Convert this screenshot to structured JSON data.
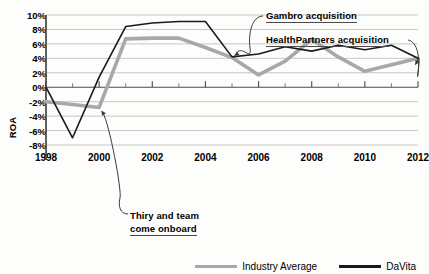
{
  "chart_data": {
    "type": "line",
    "title": "",
    "xlabel": "",
    "ylabel": "ROA",
    "xlim": [
      1998,
      2012
    ],
    "ylim": [
      -8,
      10
    ],
    "ytick_labels": [
      "10%",
      "8%",
      "6%",
      "4%",
      "2%",
      "0%",
      "-2%",
      "-4%",
      "-6%",
      "-8%"
    ],
    "ytick_values": [
      10,
      8,
      6,
      4,
      2,
      0,
      -2,
      -4,
      -6,
      -8
    ],
    "xtick_labels": [
      "1998",
      "2000",
      "2002",
      "2004",
      "2006",
      "2008",
      "2010",
      "2012"
    ],
    "xtick_values": [
      1998,
      2000,
      2002,
      2004,
      2006,
      2008,
      2010,
      2012
    ],
    "minor_xtick_values": [
      1999,
      2001,
      2003,
      2005,
      2007,
      2009,
      2011
    ],
    "grid": "horizontal",
    "legend_position": "bottom-right",
    "x": [
      1998,
      1999,
      2000,
      2001,
      2002,
      2003,
      2004,
      2005,
      2006,
      2007,
      2008,
      2009,
      2010,
      2011,
      2012
    ],
    "series": [
      {
        "name": "Industry Average",
        "color": "#a8a8a8",
        "width": 3.6,
        "values": [
          -2.0,
          -2.4,
          -2.8,
          6.7,
          6.8,
          6.8,
          5.5,
          4.1,
          1.7,
          3.6,
          6.6,
          4.2,
          2.2,
          3.1,
          4.0
        ]
      },
      {
        "name": "DaVita",
        "color": "#1a1a1a",
        "width": 1.6,
        "values": [
          0.0,
          -7.0,
          1.4,
          8.4,
          8.9,
          9.1,
          9.1,
          4.2,
          4.6,
          5.6,
          5.0,
          5.8,
          5.2,
          5.8,
          4.0
        ]
      }
    ],
    "annotations": [
      {
        "id": "gambro",
        "text": "Gambro acquisition",
        "target_x": 2005,
        "target_y": 4.2
      },
      {
        "id": "healthpartners",
        "text": "HealthPartners acquisition",
        "target_x": 2012,
        "target_y": 4.0
      },
      {
        "id": "thiry",
        "line1": "Thiry and team",
        "line2": "come onboard",
        "target_x": 2000,
        "target_y": -2.8
      }
    ]
  },
  "legend": {
    "items": [
      {
        "label": "Industry Average"
      },
      {
        "label": "DaVita"
      }
    ]
  },
  "axis": {
    "y_title": "ROA"
  }
}
